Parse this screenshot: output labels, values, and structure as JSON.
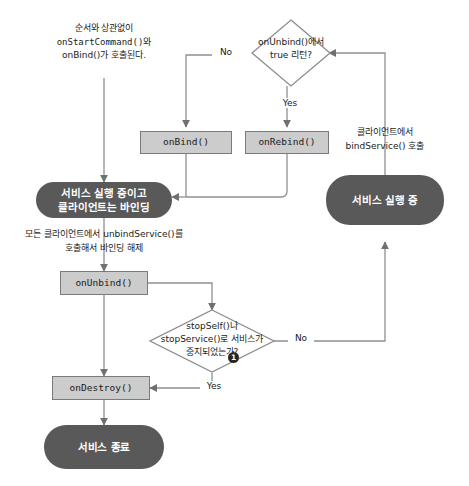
{
  "diagram": {
    "colors": {
      "state_fill": "#595959",
      "state_text": "#ffffff",
      "process_fill": "#cccccc",
      "process_border": "#7a7a7a",
      "edge": "#808080",
      "badge_fill": "#262626",
      "background": "#ffffff"
    }
  },
  "annotations": [
    {
      "id": "start-note",
      "lines": [
        "순서와 상관없이",
        "onStartCommand()와",
        "onBind()가 호출된다."
      ]
    },
    {
      "id": "unbind-note",
      "lines": [
        "모든 클라이언트에서 unbindService()를",
        "호출해서 바인딩 해제"
      ]
    },
    {
      "id": "bindservice-note",
      "lines": [
        "클라이언트에서",
        "bindService() 호출"
      ]
    }
  ],
  "nodes": {
    "decision_unbind_true": {
      "type": "decision",
      "lines": [
        "onUnbind()에서",
        "true 리턴?"
      ]
    },
    "on_bind": {
      "type": "process",
      "label": "onBind()"
    },
    "on_rebind": {
      "type": "process",
      "label": "onRebind()"
    },
    "state_running_bound": {
      "type": "state",
      "lines": [
        "서비스 실행 중이고",
        "클라이언트는 바인딩"
      ]
    },
    "state_running": {
      "type": "state",
      "lines": [
        "서비스 실행 중"
      ]
    },
    "on_unbind": {
      "type": "process",
      "label": "onUnbind()"
    },
    "decision_stopped": {
      "type": "decision",
      "lines": [
        "stopSelf()나",
        "stopService()로 서비스가",
        "중지되었는가?"
      ],
      "badge": "1"
    },
    "on_destroy": {
      "type": "process",
      "label": "onDestroy()"
    },
    "state_terminated": {
      "type": "state",
      "lines": [
        "서비스 종료"
      ]
    }
  },
  "edge_labels": {
    "unbind_true_no": "No",
    "unbind_true_yes": "Yes",
    "stopped_no": "No",
    "stopped_yes": "Yes"
  }
}
